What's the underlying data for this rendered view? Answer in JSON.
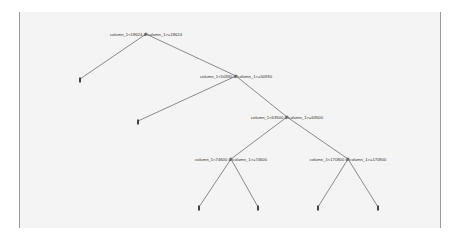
{
  "diagram": {
    "type": "decision-tree",
    "background_color": "#f4f4f4",
    "edge_color": "#6e6e6e",
    "nodes": [
      {
        "id": "n0",
        "label": "column_1<18624 & column_1>=18624",
        "x": 146,
        "y": 34
      },
      {
        "id": "n1",
        "label": "column_1<50930 & column_1>=50930",
        "x": 236,
        "y": 76
      },
      {
        "id": "n2",
        "label": "column_1<63500 & column_1>=63500",
        "x": 287,
        "y": 117
      },
      {
        "id": "n3",
        "label": "column_1<74600 & column_1>=74600",
        "x": 231,
        "y": 159
      },
      {
        "id": "n4",
        "label": "column_1<170800 & column_1>=170800",
        "x": 348,
        "y": 159
      }
    ],
    "leaves": [
      {
        "id": "l0",
        "x": 80,
        "y": 79
      },
      {
        "id": "l1",
        "x": 138,
        "y": 121
      },
      {
        "id": "l2",
        "x": 199,
        "y": 207
      },
      {
        "id": "l3",
        "x": 258,
        "y": 207
      },
      {
        "id": "l4",
        "x": 318,
        "y": 207
      },
      {
        "id": "l5",
        "x": 378,
        "y": 207
      }
    ],
    "edges": [
      [
        "n0",
        "l0"
      ],
      [
        "n0",
        "n1"
      ],
      [
        "n1",
        "l1"
      ],
      [
        "n1",
        "n2"
      ],
      [
        "n2",
        "n3"
      ],
      [
        "n2",
        "n4"
      ],
      [
        "n3",
        "l2"
      ],
      [
        "n3",
        "l3"
      ],
      [
        "n4",
        "l4"
      ],
      [
        "n4",
        "l5"
      ]
    ]
  }
}
